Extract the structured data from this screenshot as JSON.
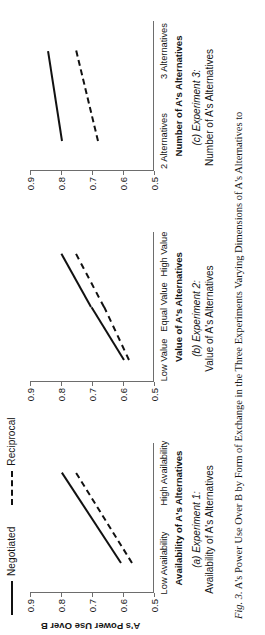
{
  "figure": {
    "caption_number": "Fig. 3.",
    "caption_text": "A's Power Use Over B by Form of Exchange in the Three Experiments Varying Dimensions of A's Alternatives to"
  },
  "legend": {
    "position": "top-left",
    "entries": [
      {
        "label": "Negotiated",
        "style": "solid",
        "color": "#111111"
      },
      {
        "label": "Reciprocal",
        "style": "dashed",
        "color": "#111111"
      }
    ]
  },
  "axis": {
    "y_title": "A's Power Use Over B",
    "y_ticks": [
      "0.9",
      "0.8",
      "0.7",
      "0.6",
      "0.5"
    ],
    "y_min": 0.5,
    "y_max": 0.9
  },
  "panels": [
    {
      "id": "a",
      "sub_label": "(a) Experiment 1:",
      "sub_title": "Availability of A's Alternatives",
      "x_title": "Availability of A's Alternatives",
      "x_categories": [
        "Low Availability",
        "High Availability"
      ],
      "show_y_axis_title": true
    },
    {
      "id": "b",
      "sub_label": "(b) Experiment 2:",
      "sub_title": "Value of A's Alternatives",
      "x_title": "Value of A's Alternatives",
      "x_categories": [
        "Low Value",
        "Equal Value",
        "High Value"
      ],
      "show_y_axis_title": false
    },
    {
      "id": "c",
      "sub_label": "(c) Experiment 3:",
      "sub_title": "Number of A's Alternatives",
      "x_title": "Number of A's Alternatives",
      "x_categories": [
        "2 Alternatives",
        "3 Alternatives"
      ],
      "show_y_axis_title": false
    }
  ],
  "chart_data": [
    {
      "type": "line",
      "panel": "a",
      "title": "(a) Experiment 1: Availability of A's Alternatives",
      "xlabel": "Availability of A's Alternatives",
      "ylabel": "A's Power Use Over B",
      "categories": [
        "Low Availability",
        "High Availability"
      ],
      "ylim": [
        0.5,
        0.9
      ],
      "yticks": [
        0.5,
        0.6,
        0.7,
        0.8,
        0.9
      ],
      "grid": false,
      "legend": "top-left",
      "series": [
        {
          "name": "Negotiated",
          "style": "solid",
          "values": [
            0.61,
            0.8
          ]
        },
        {
          "name": "Reciprocal",
          "style": "dashed",
          "values": [
            0.575,
            0.755
          ]
        }
      ]
    },
    {
      "type": "line",
      "panel": "b",
      "title": "(b) Experiment 2: Value of A's Alternatives",
      "xlabel": "Value of A's Alternatives",
      "ylabel": "A's Power Use Over B",
      "categories": [
        "Low Value",
        "Equal Value",
        "High Value"
      ],
      "ylim": [
        0.5,
        0.9
      ],
      "yticks": [
        0.5,
        0.6,
        0.7,
        0.8,
        0.9
      ],
      "grid": false,
      "legend": "top-left",
      "series": [
        {
          "name": "Negotiated",
          "style": "solid",
          "values": [
            0.6,
            0.705,
            0.8
          ]
        },
        {
          "name": "Reciprocal",
          "style": "dashed",
          "values": [
            0.585,
            0.665,
            0.755
          ]
        }
      ]
    },
    {
      "type": "line",
      "panel": "c",
      "title": "(c) Experiment 3: Number of A's Alternatives",
      "xlabel": "Number of A's Alternatives",
      "ylabel": "A's Power Use Over B",
      "categories": [
        "2 Alternatives",
        "3 Alternatives"
      ],
      "ylim": [
        0.5,
        0.9
      ],
      "yticks": [
        0.5,
        0.6,
        0.7,
        0.8,
        0.9
      ],
      "grid": false,
      "legend": "top-left",
      "series": [
        {
          "name": "Negotiated",
          "style": "solid",
          "values": [
            0.8,
            0.845
          ]
        },
        {
          "name": "Reciprocal",
          "style": "dashed",
          "values": [
            0.685,
            0.755
          ]
        }
      ]
    }
  ]
}
